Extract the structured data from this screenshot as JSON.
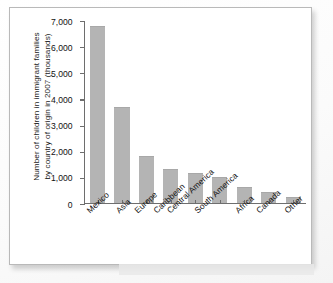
{
  "figure": {
    "caption_partial": "",
    "frame_color": "#b9b9b9"
  },
  "chart_data": {
    "type": "bar",
    "title": "",
    "xlabel": "",
    "ylabel": "Number of children in immigrant families by country of origin in 2007 (thousands)",
    "ylabel_line1": "Number of children in immigrant families",
    "ylabel_line2": "by country of origin in 2007 (thousands)",
    "categories": [
      "Mexico",
      "Asia",
      "Europe",
      "Caribbean",
      "Central America",
      "South America",
      "Africa",
      "Canada",
      "Other"
    ],
    "values": [
      6800,
      3670,
      1760,
      1270,
      1090,
      940,
      580,
      380,
      160
    ],
    "ylim": [
      0,
      7000
    ],
    "ytick_values": [
      7000,
      6000,
      5000,
      4000,
      3000,
      2000,
      1000,
      0
    ],
    "ytick_labels": [
      "7,000",
      "6,000",
      "5,000",
      "4,000",
      "3,000",
      "2,000",
      "1,000",
      "0"
    ],
    "grid": false,
    "legend": null,
    "bar_color": "#b4b4b4",
    "axis_color": "#6e6e6e"
  }
}
